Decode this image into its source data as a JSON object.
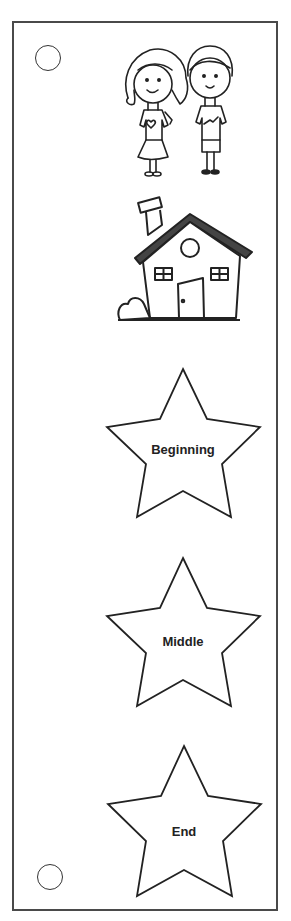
{
  "card": {
    "title": "Story Sequence Bookmark",
    "illustrations": [
      {
        "name": "characters",
        "description": "girl and boy characters"
      },
      {
        "name": "setting",
        "description": "house with chimney and bush"
      }
    ],
    "stars": [
      {
        "label": "Beginning"
      },
      {
        "label": "Middle"
      },
      {
        "label": "End"
      }
    ],
    "colors": {
      "stroke": "#222222",
      "background": "#ffffff",
      "border": "#4a4a4a"
    }
  }
}
